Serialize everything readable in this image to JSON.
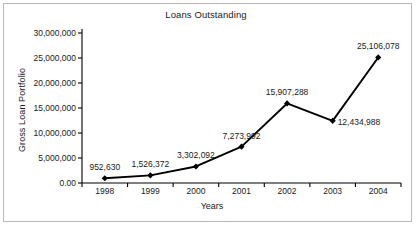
{
  "chart_data": {
    "type": "line",
    "title": "Loans Outstanding",
    "xlabel": "Years",
    "ylabel": "Gross Loan Portfolio",
    "categories": [
      "1998",
      "1999",
      "2000",
      "2001",
      "2002",
      "2003",
      "2004"
    ],
    "values": [
      952630,
      1526372,
      3302092,
      7273992,
      15907288,
      12434988,
      25106078
    ],
    "point_labels": [
      "952,630",
      "1,526,372",
      "3,302,092",
      "7,273,992",
      "15,907,288",
      "12,434,988",
      "25,106,078"
    ],
    "label_positions": [
      "above",
      "above",
      "above",
      "above",
      "above",
      "right",
      "above"
    ],
    "ylim": [
      0,
      30000000
    ],
    "ytick_values": [
      0,
      5000000,
      10000000,
      15000000,
      20000000,
      25000000,
      30000000
    ],
    "ytick_labels": [
      "0.00",
      "5,000,000",
      "10,000,000",
      "15,000,000",
      "20,000,000",
      "25,000,000",
      "30,000,000"
    ],
    "grid": false,
    "legend": false,
    "marker": "diamond",
    "series_color": "#000000",
    "frame_color": "#b9b9b9",
    "axis_color": "#000000"
  }
}
